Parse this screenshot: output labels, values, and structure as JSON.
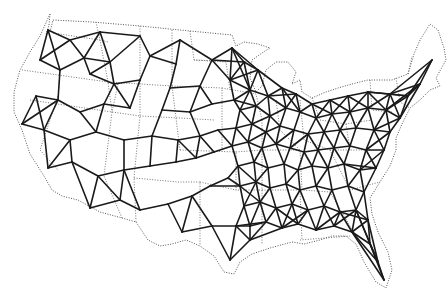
{
  "map": {
    "subject": "Continental United States network map",
    "colors": {
      "background": "#ffffff",
      "network": "#1a1a1a",
      "boundary": "#555555"
    },
    "outline": [
      [
        50,
        14
      ],
      [
        49,
        25
      ],
      [
        46,
        34
      ],
      [
        50,
        32
      ],
      [
        53,
        20
      ],
      [
        92,
        22
      ],
      [
        140,
        26
      ],
      [
        190,
        31
      ],
      [
        232,
        35
      ],
      [
        236,
        46
      ],
      [
        244,
        42
      ],
      [
        258,
        44
      ],
      [
        270,
        48
      ],
      [
        262,
        53
      ],
      [
        252,
        60
      ],
      [
        250,
        78
      ],
      [
        256,
        92
      ],
      [
        262,
        86
      ],
      [
        266,
        70
      ],
      [
        276,
        62
      ],
      [
        288,
        62
      ],
      [
        296,
        72
      ],
      [
        292,
        84
      ],
      [
        300,
        80
      ],
      [
        302,
        92
      ],
      [
        312,
        98
      ],
      [
        326,
        92
      ],
      [
        338,
        88
      ],
      [
        352,
        84
      ],
      [
        368,
        80
      ],
      [
        392,
        80
      ],
      [
        408,
        74
      ],
      [
        414,
        54
      ],
      [
        420,
        40
      ],
      [
        430,
        24
      ],
      [
        438,
        30
      ],
      [
        444,
        48
      ],
      [
        446,
        60
      ],
      [
        436,
        78
      ],
      [
        440,
        86
      ],
      [
        430,
        90
      ],
      [
        420,
        100
      ],
      [
        410,
        108
      ],
      [
        402,
        124
      ],
      [
        396,
        138
      ],
      [
        396,
        150
      ],
      [
        390,
        166
      ],
      [
        380,
        182
      ],
      [
        370,
        198
      ],
      [
        372,
        214
      ],
      [
        378,
        232
      ],
      [
        388,
        252
      ],
      [
        392,
        270
      ],
      [
        386,
        288
      ],
      [
        376,
        282
      ],
      [
        364,
        262
      ],
      [
        356,
        244
      ],
      [
        346,
        236
      ],
      [
        332,
        236
      ],
      [
        320,
        240
      ],
      [
        304,
        244
      ],
      [
        292,
        242
      ],
      [
        270,
        248
      ],
      [
        252,
        254
      ],
      [
        240,
        262
      ],
      [
        234,
        274
      ],
      [
        224,
        272
      ],
      [
        214,
        256
      ],
      [
        200,
        246
      ],
      [
        186,
        240
      ],
      [
        172,
        244
      ],
      [
        160,
        246
      ],
      [
        148,
        240
      ],
      [
        136,
        222
      ],
      [
        122,
        218
      ],
      [
        100,
        212
      ],
      [
        78,
        200
      ],
      [
        62,
        196
      ],
      [
        52,
        190
      ],
      [
        44,
        176
      ],
      [
        30,
        154
      ],
      [
        22,
        130
      ],
      [
        14,
        112
      ],
      [
        14,
        92
      ],
      [
        20,
        70
      ],
      [
        30,
        52
      ],
      [
        40,
        36
      ],
      [
        50,
        14
      ]
    ],
    "state_lines": [
      [
        [
          53,
          33
        ],
        [
          100,
          40
        ],
        [
          108,
          42
        ]
      ],
      [
        [
          22,
          70
        ],
        [
          108,
          82
        ],
        [
          118,
          84
        ]
      ],
      [
        [
          96,
          22
        ],
        [
          100,
          40
        ],
        [
          108,
          82
        ],
        [
          112,
          112
        ]
      ],
      [
        [
          30,
          100
        ],
        [
          112,
          112
        ],
        [
          140,
          116
        ]
      ],
      [
        [
          58,
          96
        ],
        [
          40,
          150
        ],
        [
          58,
          170
        ]
      ],
      [
        [
          118,
          84
        ],
        [
          112,
          112
        ],
        [
          104,
          176
        ],
        [
          122,
          218
        ]
      ],
      [
        [
          140,
          26
        ],
        [
          140,
          116
        ],
        [
          134,
          178
        ],
        [
          136,
          222
        ]
      ],
      [
        [
          108,
          82
        ],
        [
          140,
          84
        ],
        [
          172,
          86
        ]
      ],
      [
        [
          134,
          178
        ],
        [
          178,
          182
        ],
        [
          200,
          182
        ],
        [
          200,
          246
        ]
      ],
      [
        [
          172,
          30
        ],
        [
          172,
          86
        ],
        [
          180,
          150
        ]
      ],
      [
        [
          140,
          116
        ],
        [
          180,
          118
        ],
        [
          214,
          120
        ]
      ],
      [
        [
          172,
          86
        ],
        [
          222,
          88
        ],
        [
          222,
          150
        ]
      ],
      [
        [
          180,
          150
        ],
        [
          236,
          152
        ],
        [
          236,
          190
        ]
      ],
      [
        [
          200,
          182
        ],
        [
          236,
          190
        ],
        [
          262,
          190
        ]
      ],
      [
        [
          190,
          31
        ],
        [
          194,
          60
        ],
        [
          248,
          62
        ]
      ],
      [
        [
          194,
          60
        ],
        [
          226,
          62
        ],
        [
          230,
          90
        ]
      ],
      [
        [
          222,
          88
        ],
        [
          256,
          94
        ],
        [
          262,
          120
        ]
      ],
      [
        [
          236,
          152
        ],
        [
          262,
          150
        ],
        [
          300,
          150
        ]
      ],
      [
        [
          262,
          120
        ],
        [
          262,
          190
        ],
        [
          262,
          244
        ]
      ],
      [
        [
          262,
          190
        ],
        [
          300,
          190
        ],
        [
          302,
          240
        ]
      ],
      [
        [
          300,
          150
        ],
        [
          302,
          190
        ],
        [
          330,
          192
        ]
      ],
      [
        [
          276,
          100
        ],
        [
          280,
          130
        ],
        [
          300,
          150
        ]
      ],
      [
        [
          300,
          100
        ],
        [
          304,
          140
        ],
        [
          330,
          150
        ]
      ],
      [
        [
          330,
          150
        ],
        [
          372,
          150
        ]
      ],
      [
        [
          330,
          192
        ],
        [
          356,
          236
        ]
      ],
      [
        [
          330,
          150
        ],
        [
          350,
          190
        ],
        [
          380,
          182
        ]
      ],
      [
        [
          312,
          98
        ],
        [
          320,
          120
        ],
        [
          346,
          124
        ],
        [
          372,
          120
        ]
      ],
      [
        [
          346,
          124
        ],
        [
          350,
          150
        ]
      ],
      [
        [
          370,
          80
        ],
        [
          372,
          110
        ],
        [
          392,
          112
        ]
      ],
      [
        [
          396,
          78
        ],
        [
          400,
          102
        ],
        [
          410,
          108
        ]
      ],
      [
        [
          408,
          74
        ],
        [
          412,
          56
        ]
      ],
      [
        [
          300,
          240
        ],
        [
          350,
          236
        ]
      ]
    ],
    "nodes": [
      [
        48,
        30
      ],
      [
        70,
        40
      ],
      [
        100,
        32
      ],
      [
        140,
        36
      ],
      [
        180,
        40
      ],
      [
        84,
        58
      ],
      [
        110,
        62
      ],
      [
        150,
        56
      ],
      [
        176,
        64
      ],
      [
        212,
        60
      ],
      [
        232,
        48
      ],
      [
        40,
        60
      ],
      [
        60,
        70
      ],
      [
        90,
        74
      ],
      [
        114,
        84
      ],
      [
        140,
        80
      ],
      [
        170,
        88
      ],
      [
        200,
        86
      ],
      [
        230,
        80
      ],
      [
        36,
        96
      ],
      [
        58,
        100
      ],
      [
        80,
        112
      ],
      [
        104,
        104
      ],
      [
        130,
        108
      ],
      [
        162,
        110
      ],
      [
        190,
        112
      ],
      [
        212,
        104
      ],
      [
        234,
        100
      ],
      [
        22,
        124
      ],
      [
        44,
        130
      ],
      [
        70,
        140
      ],
      [
        96,
        132
      ],
      [
        124,
        140
      ],
      [
        152,
        136
      ],
      [
        178,
        140
      ],
      [
        200,
        136
      ],
      [
        218,
        130
      ],
      [
        48,
        168
      ],
      [
        72,
        162
      ],
      [
        98,
        176
      ],
      [
        124,
        170
      ],
      [
        150,
        166
      ],
      [
        176,
        162
      ],
      [
        196,
        158
      ],
      [
        214,
        152
      ],
      [
        90,
        208
      ],
      [
        120,
        200
      ],
      [
        140,
        210
      ],
      [
        168,
        204
      ],
      [
        192,
        196
      ],
      [
        210,
        186
      ],
      [
        228,
        178
      ],
      [
        182,
        232
      ],
      [
        212,
        226
      ],
      [
        236,
        226
      ],
      [
        230,
        260
      ],
      [
        250,
        240
      ],
      [
        244,
        62
      ],
      [
        258,
        70
      ],
      [
        250,
        90
      ],
      [
        268,
        96
      ],
      [
        282,
        88
      ],
      [
        296,
        94
      ],
      [
        312,
        104
      ],
      [
        330,
        100
      ],
      [
        348,
        96
      ],
      [
        368,
        92
      ],
      [
        390,
        94
      ],
      [
        408,
        96
      ],
      [
        420,
        84
      ],
      [
        432,
        60
      ],
      [
        240,
        110
      ],
      [
        256,
        106
      ],
      [
        270,
        116
      ],
      [
        286,
        108
      ],
      [
        300,
        112
      ],
      [
        316,
        118
      ],
      [
        332,
        114
      ],
      [
        350,
        112
      ],
      [
        368,
        108
      ],
      [
        386,
        110
      ],
      [
        400,
        118
      ],
      [
        236,
        128
      ],
      [
        252,
        124
      ],
      [
        266,
        132
      ],
      [
        280,
        126
      ],
      [
        294,
        130
      ],
      [
        308,
        134
      ],
      [
        324,
        132
      ],
      [
        340,
        130
      ],
      [
        356,
        128
      ],
      [
        374,
        130
      ],
      [
        390,
        132
      ],
      [
        232,
        146
      ],
      [
        248,
        142
      ],
      [
        262,
        148
      ],
      [
        276,
        144
      ],
      [
        290,
        148
      ],
      [
        304,
        152
      ],
      [
        318,
        150
      ],
      [
        334,
        148
      ],
      [
        350,
        146
      ],
      [
        366,
        150
      ],
      [
        384,
        150
      ],
      [
        238,
        166
      ],
      [
        254,
        162
      ],
      [
        268,
        168
      ],
      [
        284,
        164
      ],
      [
        298,
        170
      ],
      [
        312,
        166
      ],
      [
        328,
        168
      ],
      [
        344,
        164
      ],
      [
        360,
        170
      ],
      [
        376,
        168
      ],
      [
        240,
        186
      ],
      [
        256,
        182
      ],
      [
        270,
        188
      ],
      [
        286,
        184
      ],
      [
        300,
        190
      ],
      [
        316,
        186
      ],
      [
        332,
        190
      ],
      [
        348,
        186
      ],
      [
        364,
        192
      ],
      [
        244,
        206
      ],
      [
        260,
        202
      ],
      [
        276,
        208
      ],
      [
        292,
        204
      ],
      [
        308,
        210
      ],
      [
        324,
        206
      ],
      [
        340,
        212
      ],
      [
        356,
        210
      ],
      [
        250,
        226
      ],
      [
        266,
        222
      ],
      [
        282,
        228
      ],
      [
        298,
        224
      ],
      [
        316,
        230
      ],
      [
        334,
        226
      ],
      [
        352,
        232
      ],
      [
        368,
        220
      ],
      [
        370,
        244
      ],
      [
        378,
        262
      ],
      [
        384,
        280
      ]
    ]
  }
}
